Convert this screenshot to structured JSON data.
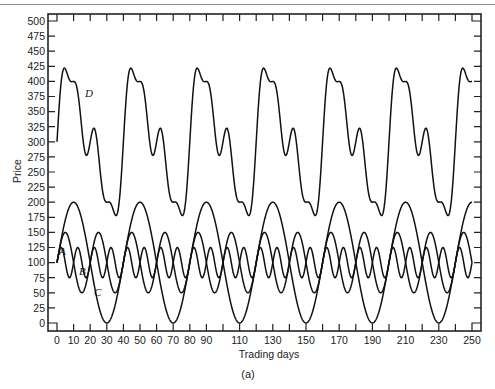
{
  "chart_data": {
    "type": "line",
    "title": "",
    "caption": "(a)",
    "xlabel": "Trading days",
    "ylabel": "Price",
    "xlim": [
      0,
      250
    ],
    "ylim": [
      0,
      500
    ],
    "grid": false,
    "legend": "inline curve labels",
    "x_tick_labels": [
      "0",
      "10",
      "20",
      "30",
      "40",
      "50",
      "60",
      "70",
      "80",
      "90",
      "110",
      "130",
      "150",
      "170",
      "190",
      "210",
      "230",
      "250"
    ],
    "x_tick_positions": [
      0,
      10,
      20,
      30,
      40,
      50,
      60,
      70,
      80,
      90,
      110,
      130,
      150,
      170,
      190,
      210,
      230,
      250
    ],
    "x_minor_ticks_every": 10,
    "y_tick_labels": [
      "0",
      "25",
      "50",
      "75",
      "100",
      "125",
      "150",
      "175",
      "200",
      "225",
      "250",
      "275",
      "300",
      "325",
      "350",
      "375",
      "400",
      "425",
      "450",
      "475",
      "500"
    ],
    "y_ticks_every": 25,
    "series": [
      {
        "name": "A",
        "formula": "100 + 25*sin(2*pi*t/10)",
        "mean": 100,
        "amplitude": 25,
        "period": 10,
        "min": 75,
        "max": 125,
        "label_pos": [
          3,
          87
        ]
      },
      {
        "name": "B",
        "formula": "100 + 50*sin(2*pi*t/20)",
        "mean": 100,
        "amplitude": 50,
        "period": 20,
        "min": 50,
        "max": 150,
        "label_pos": [
          15,
          52
        ]
      },
      {
        "name": "C",
        "formula": "100 + 100*sin(2*pi*t/40)",
        "mean": 100,
        "amplitude": 100,
        "period": 40,
        "min": 0,
        "max": 200,
        "label_pos": [
          24,
          18
        ]
      },
      {
        "name": "D",
        "formula": "A + B + C",
        "period": 40,
        "min": 179,
        "max": 421,
        "label_pos": [
          19,
          373
        ]
      }
    ],
    "sample_points": {
      "t": [
        0,
        5,
        10,
        17.5,
        22.5,
        30,
        35,
        40
      ],
      "D": [
        300,
        421,
        400,
        278,
        322,
        200,
        179,
        300
      ]
    }
  },
  "labels": {
    "y_axis": "Price",
    "x_axis": "Trading days",
    "caption": "(a)",
    "A": "A",
    "B": "B",
    "C": "C",
    "D": "D"
  }
}
